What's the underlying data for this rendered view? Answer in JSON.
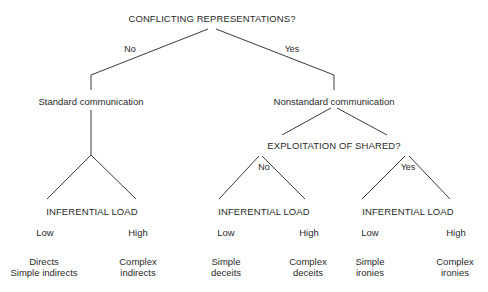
{
  "diagram": {
    "root": {
      "question": "CONFLICTING REPRESENTATIONS?",
      "no_label": "No",
      "yes_label": "Yes"
    },
    "standard": {
      "label": "Standard communication",
      "load": {
        "label": "INFERENTIAL LOAD",
        "low": "Low",
        "high": "High",
        "low_outcome_line1": "Directs",
        "low_outcome_line2": "Simple indirects",
        "high_outcome_line1": "Complex",
        "high_outcome_line2": "indirects"
      }
    },
    "nonstandard": {
      "label": "Nonstandard communication",
      "question": "EXPLOITATION OF SHARED?",
      "no_label": "No",
      "yes_label": "Yes",
      "no_load": {
        "label": "INFERENTIAL LOAD",
        "low": "Low",
        "high": "High",
        "low_outcome_line1": "Simple",
        "low_outcome_line2": "deceits",
        "high_outcome_line1": "Complex",
        "high_outcome_line2": "deceits"
      },
      "yes_load": {
        "label": "INFERENTIAL LOAD",
        "low": "Low",
        "high": "High",
        "low_outcome_line1": "Simple",
        "low_outcome_line2": "ironies",
        "high_outcome_line1": "Complex",
        "high_outcome_line2": "ironies"
      }
    },
    "colors": {
      "text": "#2a2a2a",
      "lines": "#3a3a3a",
      "background": "#ffffff"
    }
  }
}
